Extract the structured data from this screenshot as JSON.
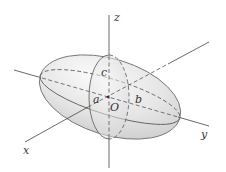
{
  "figure": {
    "axes": {
      "x_label": "x",
      "y_label": "y",
      "z_label": "z"
    },
    "semi_axis_labels": {
      "a": "a",
      "b": "b",
      "c": "c"
    },
    "origin_label": "O",
    "colors": {
      "surface_fill": "#e4e4e4",
      "surface_highlight": "#fafafa",
      "outline": "#777777",
      "axis": "#444444",
      "dashed": "#555555",
      "text": "#333333"
    }
  }
}
